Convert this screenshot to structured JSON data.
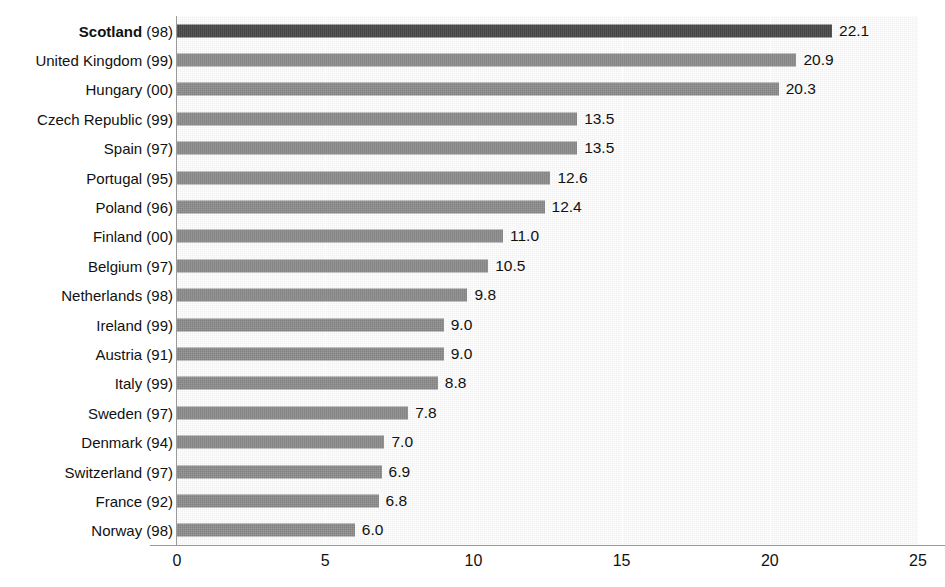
{
  "chart_data": {
    "type": "bar",
    "orientation": "horizontal",
    "title": "",
    "xlabel": "",
    "ylabel": "",
    "xlim": [
      0,
      25
    ],
    "xticks": [
      "0",
      "5",
      "10",
      "15",
      "20",
      "25"
    ],
    "xtick_values": [
      0,
      5,
      10,
      15,
      20,
      25
    ],
    "grid": "vertical",
    "legend": "none",
    "highlight_category": "Scotland (98)",
    "colors": {
      "bar": "#808080",
      "bar_highlight": "#3a3a3a",
      "plot_background": "#f2f2f2",
      "gridline": "#ffffff",
      "axis": "#9a9a9a",
      "text": "#111111"
    },
    "categories": [
      "Scotland (98)",
      "United Kingdom (99)",
      "Hungary (00)",
      "Czech Republic (99)",
      "Spain (97)",
      "Portugal (95)",
      "Poland (96)",
      "Finland (00)",
      "Belgium (97)",
      "Netherlands (98)",
      "Ireland (99)",
      "Austria (91)",
      "Italy (99)",
      "Sweden (97)",
      "Denmark (94)",
      "Switzerland (97)",
      "France (92)",
      "Norway (98)"
    ],
    "values": [
      22.1,
      20.9,
      20.3,
      13.5,
      13.5,
      12.6,
      12.4,
      11.0,
      10.5,
      9.8,
      9.0,
      9.0,
      8.8,
      7.8,
      7.0,
      6.9,
      6.8,
      6.0
    ],
    "value_labels": [
      "22.1",
      "20.9",
      "20.3",
      "13.5",
      "13.5",
      "12.6",
      "12.4",
      "11.0",
      "10.5",
      "9.8",
      "9.0",
      "9.0",
      "8.8",
      "7.8",
      "7.0",
      "6.9",
      "6.8",
      "6.0"
    ],
    "rows": [
      {
        "name": "Scotland",
        "year": "(98)",
        "value": 22.1,
        "label": "22.1",
        "highlight": true
      },
      {
        "name": "United Kingdom",
        "year": "(99)",
        "value": 20.9,
        "label": "20.9",
        "highlight": false
      },
      {
        "name": "Hungary",
        "year": "(00)",
        "value": 20.3,
        "label": "20.3",
        "highlight": false
      },
      {
        "name": "Czech Republic",
        "year": "(99)",
        "value": 13.5,
        "label": "13.5",
        "highlight": false
      },
      {
        "name": "Spain",
        "year": "(97)",
        "value": 13.5,
        "label": "13.5",
        "highlight": false
      },
      {
        "name": "Portugal",
        "year": "(95)",
        "value": 12.6,
        "label": "12.6",
        "highlight": false
      },
      {
        "name": "Poland",
        "year": "(96)",
        "value": 12.4,
        "label": "12.4",
        "highlight": false
      },
      {
        "name": "Finland",
        "year": "(00)",
        "value": 11.0,
        "label": "11.0",
        "highlight": false
      },
      {
        "name": "Belgium",
        "year": "(97)",
        "value": 10.5,
        "label": "10.5",
        "highlight": false
      },
      {
        "name": "Netherlands",
        "year": "(98)",
        "value": 9.8,
        "label": "9.8",
        "highlight": false
      },
      {
        "name": "Ireland",
        "year": "(99)",
        "value": 9.0,
        "label": "9.0",
        "highlight": false
      },
      {
        "name": "Austria",
        "year": "(91)",
        "value": 9.0,
        "label": "9.0",
        "highlight": false
      },
      {
        "name": "Italy",
        "year": "(99)",
        "value": 8.8,
        "label": "8.8",
        "highlight": false
      },
      {
        "name": "Sweden",
        "year": "(97)",
        "value": 7.8,
        "label": "7.8",
        "highlight": false
      },
      {
        "name": "Denmark",
        "year": "(94)",
        "value": 7.0,
        "label": "7.0",
        "highlight": false
      },
      {
        "name": "Switzerland",
        "year": "(97)",
        "value": 6.9,
        "label": "6.9",
        "highlight": false
      },
      {
        "name": "France",
        "year": "(92)",
        "value": 6.8,
        "label": "6.8",
        "highlight": false
      },
      {
        "name": "Norway",
        "year": "(98)",
        "value": 6.0,
        "label": "6.0",
        "highlight": false
      }
    ]
  }
}
